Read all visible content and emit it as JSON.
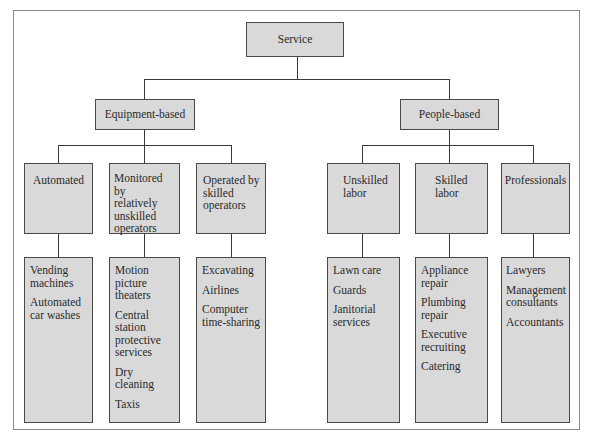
{
  "diagram": {
    "root": {
      "label": "Service"
    },
    "categories": [
      {
        "label": "Equipment-based",
        "subcategories": [
          {
            "label_lines": [
              "Automated"
            ],
            "examples": [
              [
                "Vending",
                "machines"
              ],
              [
                "Automated",
                "car washes"
              ]
            ]
          },
          {
            "label_lines": [
              "Monitored by",
              "relatively",
              "unskilled",
              "operators"
            ],
            "examples": [
              [
                "Motion",
                "picture",
                "theaters"
              ],
              [
                "Central",
                "station",
                "protective",
                "services"
              ],
              [
                "Dry",
                "cleaning"
              ],
              [
                "Taxis"
              ]
            ]
          },
          {
            "label_lines": [
              "Operated by",
              "skilled",
              "operators"
            ],
            "examples": [
              [
                "Excavating"
              ],
              [
                "Airlines"
              ],
              [
                "Computer",
                "time-sharing"
              ]
            ]
          }
        ]
      },
      {
        "label": "People-based",
        "subcategories": [
          {
            "label_lines": [
              "Unskilled",
              "labor"
            ],
            "examples": [
              [
                "Lawn care"
              ],
              [
                "Guards"
              ],
              [
                "Janitorial",
                "services"
              ]
            ]
          },
          {
            "label_lines": [
              "Skilled",
              "labor"
            ],
            "examples": [
              [
                "Appliance",
                "repair"
              ],
              [
                "Plumbing",
                "repair"
              ],
              [
                "Executive",
                "recruiting"
              ],
              [
                "Catering"
              ]
            ]
          },
          {
            "label_lines": [
              "Professionals"
            ],
            "examples": [
              [
                "Lawyers"
              ],
              [
                "Management",
                "consultants"
              ],
              [
                "Accountants"
              ]
            ]
          }
        ]
      }
    ]
  },
  "colors": {
    "box_fill": "#d9d9d9",
    "box_border": "#4a4a4a",
    "line": "#3a3a3a",
    "frame": "#8a8a8a"
  }
}
